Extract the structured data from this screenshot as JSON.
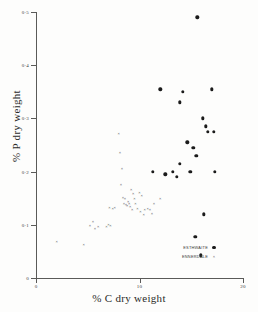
{
  "chart_data": {
    "type": "scatter",
    "title": "",
    "xlabel": "% C dry weight",
    "ylabel": "% P dry weight",
    "xlim": [
      0,
      20
    ],
    "ylim": [
      0,
      0.5
    ],
    "xticks": [
      0,
      10,
      20
    ],
    "xtick_labels": [
      "0",
      "10",
      "20"
    ],
    "yticks": [
      0,
      0.1,
      0.2,
      0.3,
      0.4,
      0.5
    ],
    "ytick_labels": [
      "0",
      "0·1",
      "0·2",
      "0·3",
      "0·4",
      "0·5"
    ],
    "grid": false,
    "legend_position": "lower right",
    "series": [
      {
        "name": "ESTHWAITE",
        "marker": "filled-circle",
        "color": "#1b1b1b",
        "points": [
          [
            15.6,
            0.49
          ],
          [
            12.0,
            0.355
          ],
          [
            17.0,
            0.355
          ],
          [
            14.2,
            0.35
          ],
          [
            13.9,
            0.33
          ],
          [
            16.1,
            0.3
          ],
          [
            16.4,
            0.285
          ],
          [
            16.6,
            0.275
          ],
          [
            17.2,
            0.275
          ],
          [
            14.6,
            0.255
          ],
          [
            15.2,
            0.245
          ],
          [
            15.5,
            0.23
          ],
          [
            13.9,
            0.215
          ],
          [
            11.3,
            0.2
          ],
          [
            13.2,
            0.2
          ],
          [
            14.9,
            0.2
          ],
          [
            17.3,
            0.2
          ],
          [
            12.5,
            0.195
          ],
          [
            13.6,
            0.19
          ],
          [
            16.2,
            0.12
          ],
          [
            15.4,
            0.078
          ],
          [
            15.9,
            0.043
          ]
        ]
      },
      {
        "name": "ENNERDALE",
        "marker": "cross",
        "color": "#2e2e2e",
        "points": [
          [
            2.0,
            0.068
          ],
          [
            4.6,
            0.062
          ],
          [
            5.2,
            0.098
          ],
          [
            5.5,
            0.105
          ],
          [
            5.7,
            0.092
          ],
          [
            6.0,
            0.095
          ],
          [
            6.8,
            0.095
          ],
          [
            7.0,
            0.1
          ],
          [
            7.2,
            0.098
          ],
          [
            7.1,
            0.132
          ],
          [
            7.4,
            0.13
          ],
          [
            7.6,
            0.132
          ],
          [
            8.0,
            0.27
          ],
          [
            8.1,
            0.235
          ],
          [
            8.3,
            0.205
          ],
          [
            8.2,
            0.175
          ],
          [
            8.4,
            0.15
          ],
          [
            8.6,
            0.148
          ],
          [
            8.5,
            0.14
          ],
          [
            8.7,
            0.138
          ],
          [
            8.9,
            0.142
          ],
          [
            8.8,
            0.135
          ],
          [
            9.0,
            0.14
          ],
          [
            9.1,
            0.133
          ],
          [
            9.2,
            0.165
          ],
          [
            9.4,
            0.158
          ],
          [
            9.5,
            0.148
          ],
          [
            9.6,
            0.14
          ],
          [
            9.3,
            0.128
          ],
          [
            9.8,
            0.13
          ],
          [
            10.0,
            0.16
          ],
          [
            10.2,
            0.155
          ],
          [
            10.1,
            0.125
          ],
          [
            10.5,
            0.128
          ],
          [
            10.4,
            0.118
          ],
          [
            10.8,
            0.13
          ],
          [
            11.0,
            0.128
          ],
          [
            11.4,
            0.14
          ],
          [
            11.2,
            0.12
          ],
          [
            12.0,
            0.148
          ]
        ]
      }
    ]
  }
}
